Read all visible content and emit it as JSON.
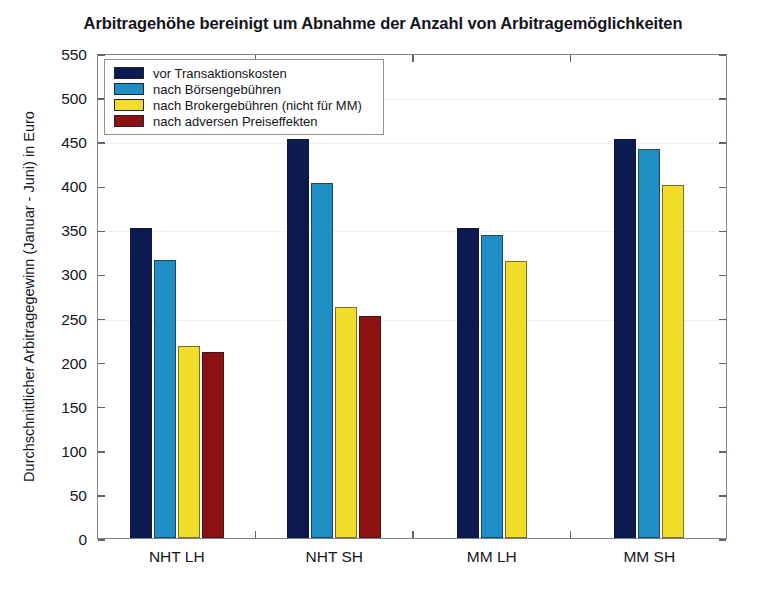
{
  "chart_data": {
    "type": "bar",
    "title": "Arbitragehöhe bereinigt um Abnahme der Anzahl von Arbitragemöglichkeiten",
    "xlabel": "",
    "ylabel": "Durchschnittlicher Arbitragegewinn (Januar - Juni) in Euro",
    "categories": [
      "NHT LH",
      "NHT SH",
      "MM LH",
      "MM SH"
    ],
    "ylim": [
      0,
      550
    ],
    "ytick_step": 50,
    "yticks": [
      0,
      50,
      100,
      150,
      200,
      250,
      300,
      350,
      400,
      450,
      500,
      550
    ],
    "grid": false,
    "legend_position": "upper-left-inside",
    "series": [
      {
        "name": "vor Transaktionskosten",
        "color": "#0d1a52",
        "values": [
          351,
          452,
          352,
          453
        ]
      },
      {
        "name": "nach Börsengebühren",
        "color": "#1f8ec4",
        "values": [
          315,
          403,
          344,
          441
        ]
      },
      {
        "name": "nach Brokergebühren (nicht für MM)",
        "color": "#f2dd2a",
        "values": [
          218,
          262,
          314,
          400
        ]
      },
      {
        "name": "nach adversen Preiseffekten",
        "color": "#8e1111",
        "values": [
          211,
          252,
          null,
          null
        ]
      }
    ]
  }
}
